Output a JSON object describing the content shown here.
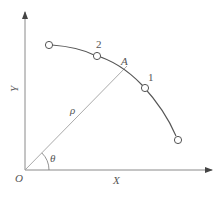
{
  "diagram": {
    "type": "polar-coordinate-trajectory",
    "axes": {
      "x_label": "X",
      "y_label": "Y",
      "origin_label": "O"
    },
    "radius_label": "ρ",
    "angle_label": "θ",
    "point_label": "A",
    "markers": [
      {
        "id": "start",
        "label": ""
      },
      {
        "id": "p2",
        "label": "2"
      },
      {
        "id": "p1",
        "label": "1"
      },
      {
        "id": "end",
        "label": ""
      }
    ],
    "colors": {
      "axis": "#8a8a8a",
      "curve": "#555555",
      "ray": "#9a9a9a",
      "text": "#555555"
    }
  }
}
